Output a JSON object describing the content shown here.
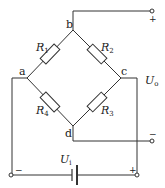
{
  "diagram": {
    "type": "wheatstone-bridge",
    "nodes": {
      "a": {
        "label": "a"
      },
      "b": {
        "label": "b"
      },
      "c": {
        "label": "c"
      },
      "d": {
        "label": "d"
      }
    },
    "resistors": [
      {
        "name": "R",
        "sub": "1",
        "between": [
          "a",
          "b"
        ]
      },
      {
        "name": "R",
        "sub": "2",
        "between": [
          "b",
          "c"
        ]
      },
      {
        "name": "R",
        "sub": "3",
        "between": [
          "c",
          "d"
        ]
      },
      {
        "name": "R",
        "sub": "4",
        "between": [
          "a",
          "d"
        ]
      }
    ],
    "output": {
      "name": "U",
      "sub": "o",
      "plus": "+",
      "minus": "−"
    },
    "input": {
      "name": "U",
      "sub": "i",
      "plus": "+",
      "minus": "−"
    }
  }
}
